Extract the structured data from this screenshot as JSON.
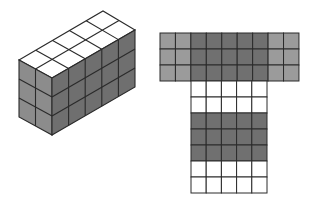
{
  "figure": {
    "colors": {
      "background": "#ffffff",
      "top_face": "#ffffff",
      "front_face": "#8c8c8c",
      "side_face": "#6f6f6f",
      "net_light": "#9b9b9b",
      "net_dark": "#707070",
      "net_white": "#ffffff",
      "grid_line": "#2a2a2a"
    },
    "cuboid": {
      "width_cubes": 2,
      "depth_cubes": 5,
      "height_cubes": 3,
      "vertices": {
        "front_top_left": [
          19,
          60
        ],
        "front_top_right": [
          52,
          78
        ],
        "back_top_right": [
          135,
          30
        ],
        "back_top_left": [
          103,
          11
        ],
        "cube_height_px": 19
      }
    },
    "net": {
      "top_band": {
        "x": 160,
        "y": 33,
        "cols": 9,
        "rows": 3,
        "cell_w": 15.44,
        "cell_h": 16,
        "column_shades": [
          "light",
          "light",
          "dark",
          "dark",
          "dark",
          "dark",
          "dark",
          "light",
          "light"
        ]
      },
      "stem": {
        "x": 191,
        "y": 81,
        "cols": 5,
        "rows": 7,
        "cell_w": 15.2,
        "cell_h": 16,
        "row_shades": [
          "white",
          "white",
          "dark",
          "dark",
          "dark",
          "white",
          "white"
        ]
      }
    }
  }
}
